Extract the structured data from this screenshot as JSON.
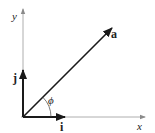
{
  "diagram": {
    "axes": {
      "x_label": "x",
      "y_label": "y"
    },
    "vectors": [
      {
        "name": "i",
        "label": "i",
        "description": "unit vector along x"
      },
      {
        "name": "j",
        "label": "j",
        "description": "unit vector along y"
      },
      {
        "name": "a",
        "label": "a",
        "description": "vector a at angle phi from x-axis"
      }
    ],
    "angle_label": "ϕ",
    "colors": {
      "axis": "#9a9a9a",
      "vector": "#1a1a1a",
      "text": "#222222",
      "background": "#ffffff"
    }
  }
}
